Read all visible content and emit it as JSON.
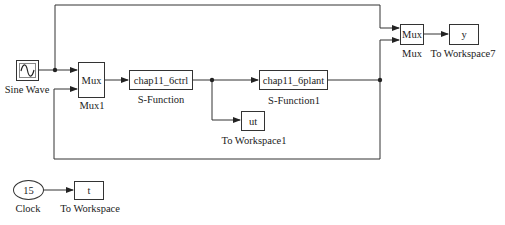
{
  "diagram": {
    "type": "simulink-block-diagram",
    "blocks": {
      "sine_wave": {
        "label": "Sine Wave",
        "icon": "sine-wave-icon"
      },
      "mux1": {
        "text": "Mux",
        "label": "Mux1"
      },
      "sfun": {
        "text": "chap11_6ctrl",
        "label": "S-Function"
      },
      "sfun1": {
        "text": "chap11_6plant",
        "label": "S-Function1"
      },
      "ut": {
        "text": "ut",
        "label": "To Workspace1"
      },
      "mux": {
        "text": "Mux",
        "label": "Mux"
      },
      "y": {
        "text": "y",
        "label": "To Workspace7"
      },
      "clock": {
        "text": "15",
        "label": "Clock"
      },
      "t": {
        "text": "t",
        "label": "To Workspace"
      }
    },
    "connections": [
      {
        "from": "Sine Wave",
        "to": "Mux1 (in1)"
      },
      {
        "from": "Sine Wave",
        "to": "Mux (in1)"
      },
      {
        "from": "Mux1",
        "to": "S-Function"
      },
      {
        "from": "S-Function",
        "to": "S-Function1"
      },
      {
        "from": "S-Function",
        "to": "To Workspace1"
      },
      {
        "from": "S-Function1",
        "to": "Mux (in2)"
      },
      {
        "from": "S-Function1",
        "to": "Mux1 (in2)"
      },
      {
        "from": "Mux",
        "to": "To Workspace7"
      },
      {
        "from": "Clock",
        "to": "To Workspace"
      }
    ],
    "colors": {
      "line": "#333333",
      "block_border": "#333333",
      "background": "#ffffff"
    }
  }
}
